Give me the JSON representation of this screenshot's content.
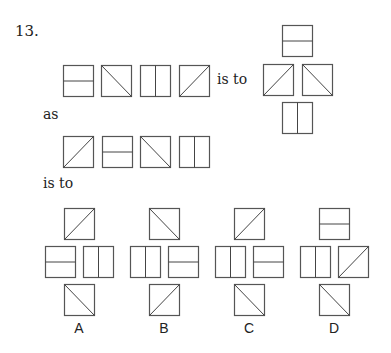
{
  "question": {
    "number": "13.",
    "phrases": {
      "is_to_1": "is to",
      "as": "as",
      "is_to_2": "is to"
    },
    "first_sequence": [
      "horizontal",
      "diag-down",
      "vertical",
      "diag-up"
    ],
    "first_result": {
      "top": "horizontal",
      "left": "diag-up",
      "right": "diag-down",
      "bottom": "vertical"
    },
    "second_sequence": [
      "diag-up",
      "horizontal",
      "diag-down",
      "vertical"
    ],
    "options": [
      {
        "label": "A",
        "top": "diag-up",
        "left": "horizontal",
        "right": "vertical",
        "bottom": "diag-down"
      },
      {
        "label": "B",
        "top": "diag-down",
        "left": "vertical",
        "right": "horizontal",
        "bottom": "diag-up"
      },
      {
        "label": "C",
        "top": "diag-up",
        "left": "vertical",
        "right": "horizontal",
        "bottom": "diag-down"
      },
      {
        "label": "D",
        "top": "horizontal",
        "left": "vertical",
        "right": "diag-up",
        "bottom": "diag-down"
      }
    ]
  }
}
